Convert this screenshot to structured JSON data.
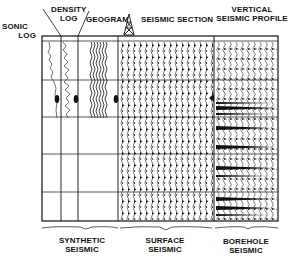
{
  "headers": {
    "sonic_log": [
      "SONIC",
      "LOG"
    ],
    "density_log": [
      "DENSITY",
      "LOG"
    ],
    "geogram": "GEOGRAM",
    "seismic_section": "SEISMIC SECTION",
    "vsp": [
      "VERTICAL",
      "SEISMIC PROFILE"
    ]
  },
  "groups": {
    "synthetic": [
      "SYNTHETIC",
      "SEISMIC"
    ],
    "surface": [
      "SURFACE",
      "SEISMIC"
    ],
    "borehole": [
      "BOREHOLE",
      "SEISMIC"
    ]
  },
  "icons": {
    "well": "drilling-derrick-icon",
    "marker": "reflector-marker-icon"
  },
  "colors": {
    "ink": "#111111",
    "background": "#ffffff"
  }
}
